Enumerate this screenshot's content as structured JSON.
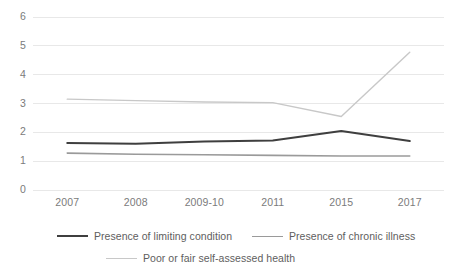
{
  "chart_data": {
    "type": "line",
    "title": "",
    "xlabel": "",
    "ylabel": "",
    "categories": [
      "2007",
      "2008",
      "2009-10",
      "2011",
      "2015",
      "2017"
    ],
    "ylim": [
      0,
      6
    ],
    "yticks": [
      "0",
      "1",
      "2",
      "3",
      "4",
      "5",
      "6"
    ],
    "grid": true,
    "legend_position": "bottom",
    "series": [
      {
        "name": "Presence of limiting condition",
        "color": "#3f3f3f",
        "width": 2.0,
        "values": [
          1.63,
          1.6,
          1.68,
          1.72,
          2.05,
          1.7
        ]
      },
      {
        "name": "Presence of chronic illness",
        "color": "#9a9a9a",
        "width": 1.6,
        "values": [
          1.28,
          1.24,
          1.22,
          1.2,
          1.18,
          1.18
        ]
      },
      {
        "name": "Poor or fair self-assessed health",
        "color": "#c8c8c8",
        "width": 1.4,
        "values": [
          3.15,
          3.1,
          3.05,
          3.03,
          2.55,
          4.78
        ]
      }
    ]
  },
  "legend": {
    "items": [
      {
        "label": "Presence of limiting condition"
      },
      {
        "label": "Presence of chronic illness"
      },
      {
        "label": "Poor or fair self-assessed health"
      }
    ]
  },
  "axes": {
    "gridline_color": "#e8e8e8",
    "tick_text_color": "#7b7b7b"
  }
}
